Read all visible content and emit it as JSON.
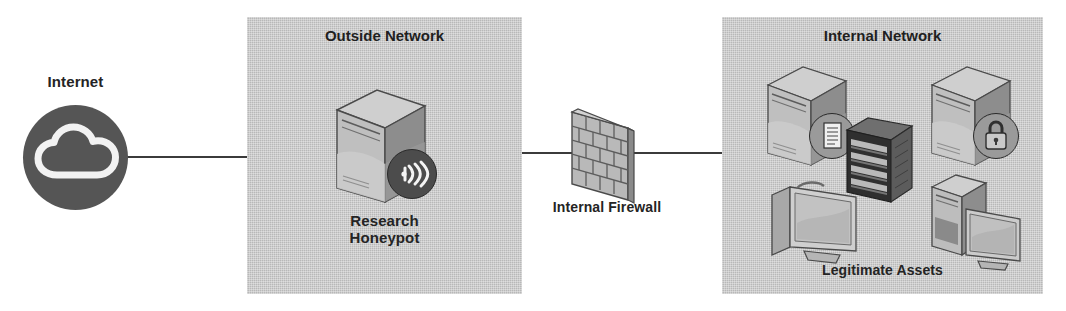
{
  "diagram": {
    "width": 1066,
    "height": 311,
    "background": "#ffffff"
  },
  "colors": {
    "zone_fill": "#b8b8b8",
    "text": "#242424",
    "line": "#3b3b3b",
    "cloud_circle": "#555555",
    "cloud_glyph": "#f2f2f2",
    "server_light": "#bdbdbd",
    "server_mid": "#9e9e9e",
    "server_dark": "#7b7b7b",
    "server_top": "#cccccc",
    "outline": "#4a4a4a",
    "brick_fill": "#b5b5b5",
    "brick_line": "#5a5a5a",
    "rack_dark": "#4a4a4a",
    "rack_face": "#2e2e2e",
    "badge_dark": "#4c4c4c",
    "badge_light": "#9a9a9a",
    "screen": "#c9c9c9"
  },
  "nodes": [
    {
      "id": "internet",
      "label": "Internet",
      "icon": "cloud-icon",
      "zone": null
    },
    {
      "id": "research-honeypot",
      "label": "Research\nHoneypot",
      "icon": "server-icon",
      "badge": "wireless-signal-icon",
      "zone": "outside-network"
    },
    {
      "id": "internal-firewall",
      "label": "Internal Firewall",
      "icon": "brick-wall-icon",
      "zone": null
    }
  ],
  "zones": [
    {
      "id": "outside-network",
      "title": "Outside Network",
      "caption": "Research\nHoneypot"
    },
    {
      "id": "internal-network",
      "title": "Internal Network",
      "caption": "Legitimate Assets"
    }
  ],
  "internal_assets": {
    "caption": "Legitimate Assets",
    "devices": [
      {
        "id": "log-server",
        "icon": "server-icon",
        "badge": "document-log-icon"
      },
      {
        "id": "secure-server",
        "icon": "server-icon",
        "badge": "padlock-icon"
      },
      {
        "id": "server-rack",
        "icon": "server-rack-icon",
        "badge": null
      },
      {
        "id": "workstation-1",
        "icon": "monitor-icon",
        "badge": null
      },
      {
        "id": "workstation-2",
        "icon": "desktop-pc-icon",
        "badge": null
      }
    ]
  },
  "links": [
    {
      "from": "internet",
      "to": "outside-network"
    },
    {
      "from": "outside-network",
      "to": "internal-firewall"
    },
    {
      "from": "internal-firewall",
      "to": "internal-network"
    }
  ]
}
